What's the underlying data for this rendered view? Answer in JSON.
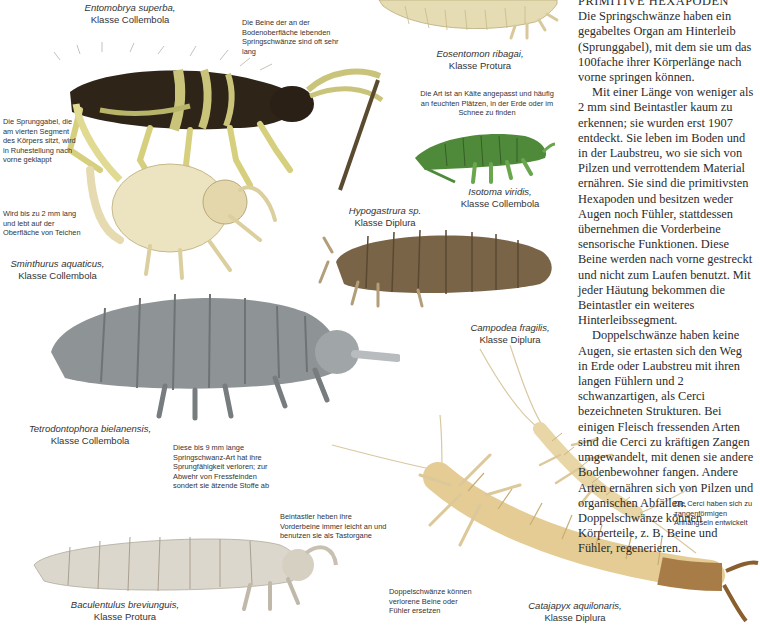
{
  "article": {
    "heading_cut": "PRIMITIVE HEXAPODEN",
    "paragraphs": [
      "Die Springschwänze haben ein gegabeltes Organ am Hinterleib (Sprunggabel), mit dem sie um das 100fache ihrer Körperlänge nach vorne springen können.",
      "Mit einer Länge von weniger als 2 mm sind Beintastler kaum zu erkennen; sie wurden erst 1907 entdeckt. Sie leben im Boden und in der Laubstreu, wo sie sich von Pilzen und verrottendem Material ernähren. Sie sind die primitivsten Hexapoden und besitzen weder Augen noch Fühler, stattdessen übernehmen die Vorderbeine sensorische Funktionen. Diese Beine werden nach vorne gestreckt und nicht zum Laufen benutzt. Mit jeder Häutung bekommen die Beintastler ein weiteres Hinterleibssegment.",
      "Doppelschwänze haben keine Augen, sie ertasten sich den Weg in Erde oder Laubstreu mit ihren langen Fühlern und 2 schwanzartigen, als Cerci bezeichneten Strukturen. Bei einigen Fleisch fressenden Arten sind die Cerci zu kräftigen Zangen umgewandelt, mit denen sie andere Bodenbewohner fangen. Andere Arten ernähren sich von Pilzen und organischen Abfällen. Doppelschwänze können Körperteile, z. B. Beine und Fühler, regenerieren."
    ]
  },
  "captions": {
    "entomobrya": {
      "species": "Entomobrya superba,",
      "class": "Klasse Collembola"
    },
    "eosentomon": {
      "species": "Eosentomon ribagai,",
      "class": "Klasse Protura"
    },
    "isotoma": {
      "species": "Isotoma viridis,",
      "class": "Klasse Collembola"
    },
    "sminthurus": {
      "species": "Sminthurus aquaticus,",
      "class": "Klasse Collembola"
    },
    "hypogastrura": {
      "species": "Hypogastrura sp.",
      "class": "Klasse Diplura"
    },
    "campodea": {
      "species": "Campodea fragilis,",
      "class": "Klasse Diplura"
    },
    "tetrodontophora": {
      "species": "Tetrodontophora bielanensis,",
      "class": "Klasse Collembola"
    },
    "baculentulus": {
      "species": "Baculentulus breviunguis,",
      "class": "Klasse Protura"
    },
    "catajapyx": {
      "species": "Catajapyx aquilonaris,",
      "class": "Klasse Diplura"
    }
  },
  "notes": {
    "legs_long": "Die Beine der an der Bodenoberfläche lebenden Springschwänze sind oft sehr lang",
    "sprunggabel": "Die Sprunggabel, die am vierten Segment des Körpers sitzt, wird in Ruhestellung nach vorne geklappt",
    "cold": "Die Art ist an Kälte angepasst und häufig an feuchten Plätzen, in der Erde oder im Schnee zu finden",
    "two_mm": "Wird bis zu 2 mm lang und lebt auf der Oberfläche von Teichen",
    "nine_mm": "Diese  bis 9 mm lange Springschwanz-Art hat ihre Sprungfähigkeit verloren; zur Abwehr von Fressfeinden sondert sie ätzende Stoffe ab",
    "front_legs": "Beintastler heben ihre Vorderbeine immer leicht an und benutzen sie als Tastorgane",
    "regenerate": "Doppelschwänze können verlorene Beine oder Fühler ersetzen",
    "cerci": "Die Cerci haben sich zu zangenförmigen Anhängseln entwickelt"
  },
  "colors": {
    "entomobrya_body": "#2e2418",
    "entomobrya_band": "#c9c47a",
    "eosentomon": "#e6dcb4",
    "isotoma": "#4f8a3a",
    "sminthurus": "#ece3c0",
    "hypogastrura": "#7a6448",
    "tetrodontophora": "#8e9396",
    "baculentulus": "#dcd7cc",
    "campodea": "#e8d6a6",
    "catajapyx": "#e4cc94",
    "catajapyx_tail": "#a87c46"
  }
}
